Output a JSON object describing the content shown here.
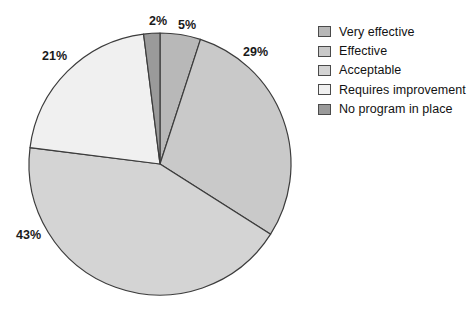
{
  "chart_data": {
    "type": "pie",
    "title": "",
    "categories": [
      "Very effective",
      "Effective",
      "Acceptable",
      "Requires improvement",
      "No program in place"
    ],
    "values": [
      5,
      29,
      43,
      21,
      2
    ],
    "value_labels": [
      "5%",
      "29%",
      "43%",
      "21%",
      "2%"
    ],
    "colors": [
      "#b8b8b8",
      "#c9c9c9",
      "#d4d4d4",
      "#f0f0f0",
      "#9a9a9a"
    ],
    "legend_position": "right",
    "grid": false,
    "start_angle_deg": 0,
    "direction": "clockwise",
    "stroke_color": "#3c3c3c"
  },
  "legend": {
    "items": [
      {
        "label": "Very effective",
        "color": "#b8b8b8"
      },
      {
        "label": "Effective",
        "color": "#c9c9c9"
      },
      {
        "label": "Acceptable",
        "color": "#d4d4d4"
      },
      {
        "label": "Requires improvement",
        "color": "#f0f0f0"
      },
      {
        "label": "No program in place",
        "color": "#9a9a9a"
      }
    ]
  },
  "labels": {
    "very_effective": "5%",
    "effective": "29%",
    "acceptable": "43%",
    "requires_improvement": "21%",
    "no_program": "2%"
  }
}
